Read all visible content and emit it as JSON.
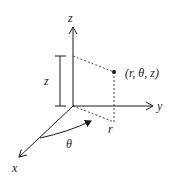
{
  "diagram": {
    "colors": {
      "stroke": "#1a1a1a",
      "background": "#ffffff"
    },
    "axes": {
      "z": {
        "label": "z"
      },
      "y": {
        "label": "y"
      },
      "x": {
        "label": "x"
      }
    },
    "point": {
      "label": "(r, θ, z)"
    },
    "dimensions": {
      "height_label": "z",
      "radius_label": "r",
      "angle_label": "θ"
    }
  }
}
